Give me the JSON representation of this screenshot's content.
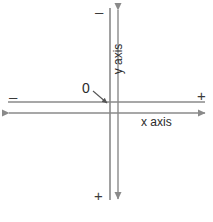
{
  "diagram": {
    "stroke_color": "#8a8a8a",
    "text_color": "#2b2b2b",
    "background_color": "#ffffff",
    "labels": {
      "minus_top": "–",
      "minus_left": "–",
      "plus_right": "+",
      "plus_bottom": "+",
      "origin": "0",
      "x_axis": "x axis",
      "y_axis": "y axis"
    },
    "geometry": {
      "plain_vertical_x": 110,
      "arrow_vertical_x": 118,
      "plain_horizontal_y": 102,
      "arrow_horizontal_y": 113,
      "vertical_top_y": 8,
      "vertical_bottom_y": 200,
      "horizontal_left_x": 8,
      "horizontal_right_x": 205,
      "origin_arrow_from": [
        93,
        91
      ],
      "origin_arrow_to": [
        108,
        104
      ]
    }
  }
}
